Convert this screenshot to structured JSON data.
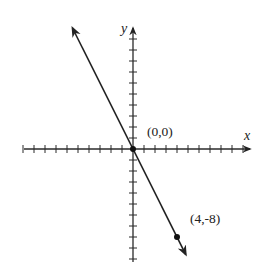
{
  "chart_data": {
    "type": "line",
    "title": "",
    "xlabel": "x",
    "ylabel": "y",
    "grid": false,
    "legend": null,
    "equation": "y = -2x",
    "xlim": [
      -10,
      11
    ],
    "ylim": [
      -10,
      11
    ],
    "tick_spacing": 1,
    "series": [
      {
        "name": "line",
        "x": [
          -5.5,
          4.8
        ],
        "y": [
          11,
          -9.6
        ],
        "arrows": "both"
      }
    ],
    "points": [
      {
        "x": 0,
        "y": 0,
        "label": "(0,0)"
      },
      {
        "x": 4,
        "y": -8,
        "label": "(4,-8)"
      }
    ],
    "annotations": [
      "(0,0)",
      "(4,-8)"
    ],
    "colors": {
      "axis": "#2a2a2a",
      "line": "#222222",
      "background": "#ffffff"
    }
  },
  "labels": {
    "x_axis": "x",
    "y_axis": "y",
    "origin": "(0,0)",
    "point": "(4,-8)"
  }
}
